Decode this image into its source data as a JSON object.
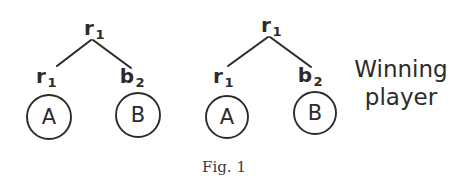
{
  "figure": {
    "caption": "Fig. 1",
    "background_color": "#ffffff",
    "ink_color": "#2b2b2b",
    "annotation": {
      "line1": "Winning",
      "line2": "player"
    },
    "trees": [
      {
        "id": "tree-left",
        "root": {
          "label_base": "r",
          "label_sub": "1"
        },
        "children": [
          {
            "id": "left-child-a",
            "edge_label_base": "r",
            "edge_label_sub": "1",
            "node_letter": "A"
          },
          {
            "id": "left-child-b",
            "edge_label_base": "b",
            "edge_label_sub": "2",
            "node_letter": "B"
          }
        ]
      },
      {
        "id": "tree-right",
        "root": {
          "label_base": "r",
          "label_sub": "1"
        },
        "children": [
          {
            "id": "right-child-a",
            "edge_label_base": "r",
            "edge_label_sub": "1",
            "node_letter": "A"
          },
          {
            "id": "right-child-b",
            "edge_label_base": "b",
            "edge_label_sub": "2",
            "node_letter": "B"
          }
        ]
      }
    ]
  }
}
